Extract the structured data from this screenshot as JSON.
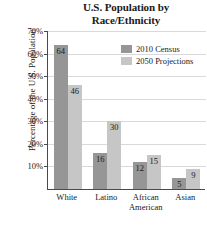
{
  "chart_data": {
    "type": "bar",
    "title": "U.S. Population by Race/Ethnicity",
    "title_lines": [
      "U.S. Population by",
      "Race/Ethnicity"
    ],
    "xlabel": "",
    "ylabel": "Percentage of the U.S. Population",
    "ylim": [
      0,
      70
    ],
    "ytick_step": 10,
    "yticks": [
      10,
      20,
      30,
      40,
      50,
      60,
      70
    ],
    "ytick_labels": [
      "10%",
      "20%",
      "30%",
      "40%",
      "50%",
      "60%",
      "70%"
    ],
    "grid": true,
    "legend_position": "upper right",
    "categories": [
      "White",
      "Latino",
      "African American",
      "Asian"
    ],
    "category_lines": [
      [
        "White"
      ],
      [
        "Latino"
      ],
      [
        "African",
        "American"
      ],
      [
        "Asian"
      ]
    ],
    "series": [
      {
        "name": "2010 Census",
        "color": "#969696",
        "values": [
          64,
          16,
          12,
          5
        ]
      },
      {
        "name": "2050 Projections",
        "color": "#c6c6c6",
        "values": [
          46,
          30,
          15,
          9
        ]
      }
    ]
  },
  "legend": {
    "entries": [
      {
        "label": "2010 Census"
      },
      {
        "label": "2050 Projections"
      }
    ]
  }
}
